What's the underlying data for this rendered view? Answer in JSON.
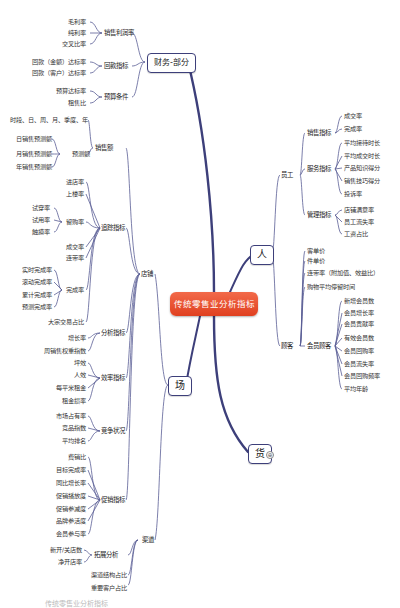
{
  "root": {
    "label": "传统零售业分析指标"
  },
  "branches": {
    "finance": {
      "label": "财务-部分",
      "children": [
        {
          "label": "销售利润率",
          "leaves": [
            "毛利率",
            "纯利率",
            "交叉比率"
          ]
        },
        {
          "label": "回款指标",
          "leaves": [
            "回款（金额）达标率",
            "回款（客户）达标率"
          ]
        },
        {
          "label": "预算条件",
          "leaves": [
            "预算达标率",
            "租售比"
          ]
        }
      ]
    },
    "people": {
      "label": "人",
      "children": [
        {
          "label": "员工",
          "groups": [
            {
              "label": "销售指标",
              "leaves": [
                "成交率",
                "完成率"
              ]
            },
            {
              "label": "服务指标",
              "leaves": [
                "平均接待时长",
                "平均成交时长",
                "产品知识得分",
                "销售技巧得分",
                "投诉率"
              ]
            },
            {
              "label": "管理指标",
              "leaves": [
                "店铺满意率",
                "员工流失率",
                "工资占比"
              ]
            }
          ]
        },
        {
          "label": "顾客",
          "groups": [
            {
              "label": "客单价"
            },
            {
              "label": "件单价"
            },
            {
              "label": "连带率（附加值、效益比）"
            },
            {
              "label": "购物平均停留时间"
            },
            {
              "label": "会员顾客",
              "leaves": [
                "新增会员数",
                "会员增长率",
                "会员贡献率",
                "有效会员数",
                "会员回购率",
                "会员流失率",
                "会员回购频率",
                "平均年龄"
              ]
            }
          ]
        }
      ]
    },
    "goods": {
      "label": "货",
      "collapse_icon": "⊕"
    },
    "venue": {
      "label": "场",
      "children": [
        {
          "label": "店铺",
          "groups": [
            {
              "label": "销售额",
              "items": [
                {
                  "label": "时段、日、周、月、季度、年"
                },
                {
                  "label": "预测额",
                  "leaves": [
                    "日销售预测额",
                    "月销售预测额",
                    "年销售预测额"
                  ]
                }
              ]
            },
            {
              "label": "追踪指标",
              "items": [
                {
                  "label": "进店率"
                },
                {
                  "label": "上楼率"
                },
                {
                  "label": "留购率",
                  "leaves": [
                    "试穿率",
                    "试用率",
                    "触摸率"
                  ]
                },
                {
                  "label": "成交率"
                },
                {
                  "label": "连带率"
                },
                {
                  "label": "完成率",
                  "leaves": [
                    "实时完成率",
                    "滚动完成率",
                    "累计完成率",
                    "预测完成率"
                  ]
                },
                {
                  "label": "大宗交易占比"
                }
              ]
            },
            {
              "label": "分析指标",
              "leaves": [
                "增长率",
                "周销售权重指数"
              ]
            },
            {
              "label": "效率指标",
              "leaves": [
                "坪效",
                "人效",
                "每平米租金",
                "租金损率"
              ]
            },
            {
              "label": "竞争状况",
              "leaves": [
                "市场占有率",
                "竞品指数",
                "平均排名"
              ]
            },
            {
              "label": "促销指标",
              "leaves": [
                "费销比",
                "目标完成率",
                "同比增长率",
                "促销播放度",
                "促销参减度",
                "品牌参活度",
                "会员参与率"
              ]
            }
          ]
        },
        {
          "label": "渠道",
          "groups": [
            {
              "label": "拓展分析",
              "leaves": [
                "新开/关店数",
                "净开店率"
              ]
            },
            {
              "label": "渠道结构占比"
            },
            {
              "label": "重要客户占比"
            }
          ]
        }
      ]
    }
  },
  "caption": "传统零售业分析指标",
  "colors": {
    "center": "#e8512f",
    "branch_line": "#3d3f7a",
    "leaf_line": "#8a90c0"
  }
}
